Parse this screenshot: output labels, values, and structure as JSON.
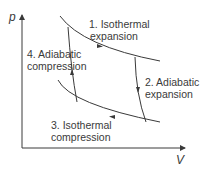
{
  "diagram": {
    "title": "",
    "axes": {
      "y_label": "p",
      "x_label": "V"
    },
    "processes": [
      {
        "id": 1,
        "line1": "1. Isothermal",
        "line2": "expansion"
      },
      {
        "id": 2,
        "line1": "2. Adiabatic",
        "line2": "expansion"
      },
      {
        "id": 3,
        "line1": "3. Isothermal",
        "line2": "compression"
      },
      {
        "id": 4,
        "line1": "4. Adiabatic",
        "line2": "compression"
      }
    ],
    "colors": {
      "line": "#3a3a3a",
      "text": "#3a3a3a",
      "background": "#ffffff"
    }
  }
}
